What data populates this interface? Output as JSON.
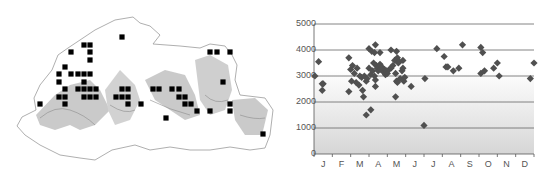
{
  "map": {
    "title": "Distribution map",
    "colors": {
      "border": "#9a9a9a",
      "relief_dark": "#8c8c8c",
      "relief_light": "#d8d8d8",
      "marker": "#000000"
    },
    "markers": [
      [
        122,
        37
      ],
      [
        84,
        45
      ],
      [
        90,
        45
      ],
      [
        71,
        52
      ],
      [
        90,
        52
      ],
      [
        90,
        60
      ],
      [
        65,
        67
      ],
      [
        59,
        74
      ],
      [
        71,
        74
      ],
      [
        78,
        74
      ],
      [
        84,
        74
      ],
      [
        90,
        74
      ],
      [
        59,
        82
      ],
      [
        84,
        82
      ],
      [
        65,
        89
      ],
      [
        78,
        89
      ],
      [
        84,
        89
      ],
      [
        90,
        89
      ],
      [
        96,
        89
      ],
      [
        122,
        89
      ],
      [
        128,
        89
      ],
      [
        59,
        97
      ],
      [
        65,
        97
      ],
      [
        84,
        97
      ],
      [
        90,
        97
      ],
      [
        96,
        97
      ],
      [
        116,
        97
      ],
      [
        122,
        97
      ],
      [
        128,
        97
      ],
      [
        40,
        104
      ],
      [
        65,
        104
      ],
      [
        128,
        104
      ],
      [
        141,
        104
      ],
      [
        153,
        89
      ],
      [
        159,
        89
      ],
      [
        172,
        89
      ],
      [
        179,
        89
      ],
      [
        179,
        97
      ],
      [
        185,
        97
      ],
      [
        185,
        104
      ],
      [
        191,
        104
      ],
      [
        197,
        111
      ],
      [
        166,
        118
      ],
      [
        210,
        52
      ],
      [
        217,
        52
      ],
      [
        230,
        52
      ],
      [
        223,
        82
      ],
      [
        230,
        104
      ],
      [
        230,
        111
      ],
      [
        210,
        111
      ],
      [
        263,
        134
      ]
    ]
  },
  "chart_data": {
    "type": "scatter",
    "title": "",
    "xlabel": "",
    "ylabel": "",
    "x_tick_labels": [
      "J",
      "F",
      "M",
      "A",
      "M",
      "J",
      "J",
      "A",
      "S",
      "O",
      "N",
      "D"
    ],
    "y_tick_labels": [
      "0",
      "1000",
      "2000",
      "3000",
      "4000",
      "5000"
    ],
    "ylim": [
      0,
      5000
    ],
    "xlim": [
      0,
      12
    ],
    "grid": true,
    "marker": "diamond",
    "marker_color": "#505050",
    "background_gradient": [
      "#ffffff",
      "#d6d6d6"
    ],
    "points": [
      [
        0.05,
        3000
      ],
      [
        0.25,
        3550
      ],
      [
        0.45,
        2700
      ],
      [
        0.45,
        2450
      ],
      [
        0.5,
        2700
      ],
      [
        1.9,
        3700
      ],
      [
        1.9,
        2400
      ],
      [
        2.0,
        3250
      ],
      [
        2.05,
        2800
      ],
      [
        2.1,
        3400
      ],
      [
        2.2,
        3100
      ],
      [
        2.3,
        2750
      ],
      [
        2.35,
        3300
      ],
      [
        2.45,
        2650
      ],
      [
        2.5,
        3000
      ],
      [
        2.6,
        2950
      ],
      [
        2.65,
        2450
      ],
      [
        2.7,
        2200
      ],
      [
        2.75,
        3000
      ],
      [
        2.85,
        2800
      ],
      [
        2.85,
        1500
      ],
      [
        2.9,
        2900
      ],
      [
        3.0,
        3300
      ],
      [
        3.0,
        4050
      ],
      [
        3.1,
        1700
      ],
      [
        3.1,
        3050
      ],
      [
        3.15,
        3950
      ],
      [
        3.2,
        3200
      ],
      [
        3.25,
        3500
      ],
      [
        3.3,
        3000
      ],
      [
        3.3,
        3900
      ],
      [
        3.35,
        4200
      ],
      [
        3.35,
        2600
      ],
      [
        3.35,
        2850
      ],
      [
        3.4,
        3400
      ],
      [
        3.45,
        3300
      ],
      [
        3.5,
        3200
      ],
      [
        3.55,
        3350
      ],
      [
        3.6,
        3450
      ],
      [
        3.6,
        3900
      ],
      [
        3.65,
        3250
      ],
      [
        3.7,
        3350
      ],
      [
        3.75,
        3200
      ],
      [
        3.8,
        3150
      ],
      [
        3.85,
        3250
      ],
      [
        3.9,
        3050
      ],
      [
        3.95,
        3200
      ],
      [
        4.0,
        3100
      ],
      [
        4.1,
        3250
      ],
      [
        4.2,
        4000
      ],
      [
        4.2,
        3300
      ],
      [
        4.3,
        3400
      ],
      [
        4.4,
        3600
      ],
      [
        4.45,
        3100
      ],
      [
        4.45,
        2200
      ],
      [
        4.5,
        3950
      ],
      [
        4.5,
        2800
      ],
      [
        4.55,
        2750
      ],
      [
        4.55,
        3700
      ],
      [
        4.6,
        3500
      ],
      [
        4.65,
        3550
      ],
      [
        4.7,
        2900
      ],
      [
        4.8,
        3200
      ],
      [
        4.85,
        3300
      ],
      [
        4.85,
        3600
      ],
      [
        4.9,
        2800
      ],
      [
        4.95,
        2950
      ],
      [
        5.3,
        2600
      ],
      [
        6.0,
        1100
      ],
      [
        6.05,
        2900
      ],
      [
        6.7,
        4050
      ],
      [
        7.1,
        3750
      ],
      [
        7.2,
        3350
      ],
      [
        7.3,
        3350
      ],
      [
        7.6,
        3200
      ],
      [
        7.9,
        3300
      ],
      [
        8.1,
        4200
      ],
      [
        9.1,
        4100
      ],
      [
        9.1,
        3100
      ],
      [
        9.2,
        3900
      ],
      [
        9.3,
        3200
      ],
      [
        9.8,
        3300
      ],
      [
        10.0,
        3500
      ],
      [
        10.1,
        3000
      ],
      [
        11.8,
        2900
      ],
      [
        12.0,
        3500
      ]
    ]
  }
}
